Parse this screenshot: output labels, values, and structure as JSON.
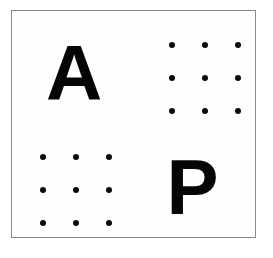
{
  "card": {
    "title": "Letter and dot-array stimulus card",
    "background_color": "#fefefe",
    "border_color": "#8b8b8b",
    "ink_color": "#050505",
    "dot_color": "#0a0a0a"
  },
  "quadrants": [
    {
      "position": "top-left",
      "kind": "letter",
      "letter": "A"
    },
    {
      "position": "top-right",
      "kind": "dot-array",
      "rows": 3,
      "columns": 3,
      "count": 9,
      "dots": [
        "•",
        "•",
        "•",
        "•",
        "•",
        "•",
        "•",
        "•",
        "•"
      ]
    },
    {
      "position": "bottom-left",
      "kind": "dot-array",
      "rows": 3,
      "columns": 3,
      "count": 9,
      "dots": [
        "•",
        "•",
        "•",
        "•",
        "•",
        "•",
        "•",
        "•",
        "•"
      ]
    },
    {
      "position": "bottom-right",
      "kind": "letter",
      "letter": "P"
    }
  ]
}
